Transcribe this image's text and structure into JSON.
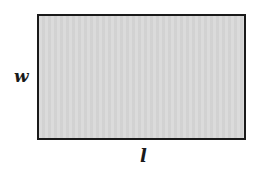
{
  "diagram": {
    "shape": "rectangle",
    "fill_color": "#d9d9d9",
    "stroke_color": "#1a1a1a",
    "labels": {
      "width": "w",
      "length": "l"
    }
  }
}
